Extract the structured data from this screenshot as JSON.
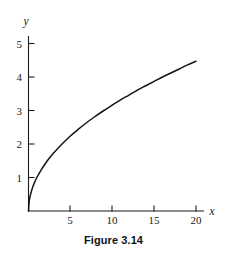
{
  "figure": {
    "caption": "Figure 3.14",
    "x_axis_name": "x",
    "y_axis_name": "y"
  },
  "chart_data": {
    "type": "line",
    "title": "Figure 3.14",
    "xlabel": "x",
    "ylabel": "y",
    "grid": false,
    "legend": null,
    "xlim": [
      0,
      21.5
    ],
    "ylim": [
      0,
      5.3
    ],
    "xticks": [
      5,
      10,
      15,
      20
    ],
    "yticks": [
      1,
      2,
      3,
      4,
      5
    ],
    "xtick_labels": [
      "5",
      "10",
      "15",
      "20"
    ],
    "ytick_labels": [
      "1",
      "2",
      "3",
      "4",
      "5"
    ],
    "series": [
      {
        "name": "y = sqrt(x)",
        "x": [
          0,
          0.1,
          0.25,
          0.5,
          0.75,
          1,
          1.5,
          2,
          2.5,
          3,
          4,
          5,
          6,
          7,
          8,
          9,
          10,
          11,
          12,
          13,
          14,
          15,
          16,
          17,
          18,
          19,
          20
        ],
        "y": [
          0,
          0.32,
          0.5,
          0.71,
          0.87,
          1,
          1.22,
          1.41,
          1.58,
          1.73,
          2,
          2.24,
          2.45,
          2.65,
          2.83,
          3,
          3.16,
          3.32,
          3.46,
          3.61,
          3.74,
          3.87,
          4,
          4.12,
          4.24,
          4.36,
          4.47
        ]
      }
    ]
  },
  "colors": {
    "background": "#ffffff",
    "ink": "#1a1a1a",
    "curve": "#141414"
  }
}
